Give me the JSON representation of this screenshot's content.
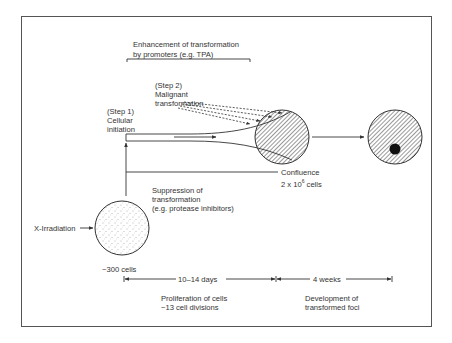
{
  "diagram": {
    "labels": {
      "enhancement_line1": "Enhancement of transformation",
      "enhancement_line2": "by promoters (e.g. TPA)",
      "step2_line1": "(Step 2)",
      "step2_line2": "Malignant",
      "step2_line3": "transformation",
      "step1_line1": "(Step 1)",
      "step1_line2": "Cellular",
      "step1_line3": "initiation",
      "confluence_line1": "Confluence",
      "confluence_line2_base": "2 x 10",
      "confluence_line2_exp": "6",
      "confluence_line2_tail": " cells",
      "suppression_line1": "Suppression of",
      "suppression_line2": "transformation",
      "suppression_line3": "(e.g. protease inhibitors)",
      "xirradiation": "X-Irradiation",
      "initial_cells": "~300 cells",
      "phase1_duration": "10–14 days",
      "phase2_duration": "4 weeks",
      "phase1_line1": "Proliferation of cells",
      "phase1_line2": "~13 cell divisions",
      "phase2_line1": "Development of",
      "phase2_line2": "transformed foci"
    },
    "nodes": [
      {
        "id": "initial-dish",
        "fill": "stippled",
        "description": "irradiated cells"
      },
      {
        "id": "confluent-dish",
        "fill": "hatched",
        "description": "confluent monolayer"
      },
      {
        "id": "foci-dish",
        "fill": "hatched",
        "description": "dish with transformed focus"
      }
    ],
    "colors": {
      "ink": "#333333",
      "frame": "#555555",
      "background": "#ffffff"
    }
  }
}
